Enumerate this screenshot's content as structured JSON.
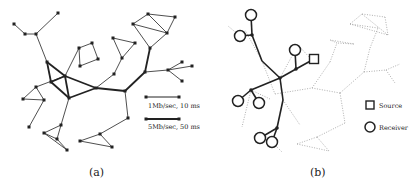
{
  "figure": {
    "panels": [
      {
        "id": "a",
        "caption": "(a)",
        "legend": [
          {
            "label": "1Mb/sec, 10 ms",
            "style": "thin"
          },
          {
            "label": "5Mb/sec, 50 ms",
            "style": "thick"
          }
        ]
      },
      {
        "id": "b",
        "caption": "(b)",
        "legend": [
          {
            "label": "Source",
            "symbol": "square"
          },
          {
            "label": "Receiver",
            "symbol": "circle"
          }
        ]
      }
    ],
    "colors": {
      "edge": "#222222",
      "node": "#222222",
      "dotted_edge": "#9a9a9a",
      "background": "#ffffff"
    }
  },
  "graph_a": {
    "nodes": [
      [
        58,
        13
      ],
      [
        14,
        24
      ],
      [
        25,
        34
      ],
      [
        36,
        34
      ],
      [
        47,
        62
      ],
      [
        65,
        76
      ],
      [
        51,
        82
      ],
      [
        69,
        98
      ],
      [
        96,
        88
      ],
      [
        125,
        91
      ],
      [
        145,
        72
      ],
      [
        150,
        48
      ],
      [
        148,
        14
      ],
      [
        133,
        24
      ],
      [
        167,
        33
      ],
      [
        175,
        17
      ],
      [
        168,
        70
      ],
      [
        182,
        62
      ],
      [
        192,
        66
      ],
      [
        182,
        81
      ],
      [
        79,
        48
      ],
      [
        92,
        43
      ],
      [
        98,
        59
      ],
      [
        80,
        66
      ],
      [
        113,
        38
      ],
      [
        135,
        43
      ],
      [
        122,
        58
      ],
      [
        114,
        74
      ],
      [
        36,
        87
      ],
      [
        23,
        99
      ],
      [
        44,
        100
      ],
      [
        29,
        127
      ],
      [
        61,
        125
      ],
      [
        44,
        133
      ],
      [
        57,
        139
      ],
      [
        67,
        150
      ],
      [
        128,
        118
      ],
      [
        100,
        134
      ],
      [
        80,
        141
      ],
      [
        112,
        147
      ]
    ],
    "thin_edges": [
      [
        0,
        3
      ],
      [
        1,
        2
      ],
      [
        2,
        3
      ],
      [
        3,
        4
      ],
      [
        5,
        20
      ],
      [
        20,
        21
      ],
      [
        21,
        22
      ],
      [
        22,
        23
      ],
      [
        23,
        20
      ],
      [
        8,
        27
      ],
      [
        27,
        26
      ],
      [
        26,
        24
      ],
      [
        24,
        25
      ],
      [
        25,
        26
      ],
      [
        9,
        36
      ],
      [
        36,
        37
      ],
      [
        37,
        38
      ],
      [
        38,
        39
      ],
      [
        39,
        37
      ],
      [
        5,
        28
      ],
      [
        28,
        29
      ],
      [
        29,
        30
      ],
      [
        30,
        28
      ],
      [
        30,
        31
      ],
      [
        7,
        32
      ],
      [
        32,
        33
      ],
      [
        33,
        34
      ],
      [
        34,
        32
      ],
      [
        33,
        35
      ],
      [
        35,
        34
      ],
      [
        10,
        16
      ],
      [
        16,
        17
      ],
      [
        16,
        18
      ],
      [
        16,
        19
      ],
      [
        11,
        13
      ],
      [
        13,
        12
      ],
      [
        12,
        14
      ],
      [
        14,
        13
      ],
      [
        14,
        15
      ],
      [
        15,
        12
      ],
      [
        11,
        14
      ]
    ],
    "thick_edges": [
      [
        4,
        6
      ],
      [
        4,
        5
      ],
      [
        6,
        5
      ],
      [
        5,
        7
      ],
      [
        6,
        7
      ],
      [
        5,
        8
      ],
      [
        7,
        8
      ],
      [
        8,
        9
      ],
      [
        9,
        10
      ],
      [
        10,
        11
      ]
    ]
  },
  "graph_b": {
    "tree_nodes": [
      [
        251,
        15
      ],
      [
        240,
        36
      ],
      [
        252,
        35
      ],
      [
        262,
        61
      ],
      [
        280,
        78
      ],
      [
        296,
        69
      ],
      [
        295,
        50
      ],
      [
        314,
        59
      ],
      [
        251,
        90
      ],
      [
        238,
        101
      ],
      [
        259,
        103
      ],
      [
        283,
        100
      ],
      [
        277,
        128
      ],
      [
        260,
        138
      ],
      [
        272,
        142
      ]
    ],
    "tree_edges": [
      [
        0,
        2
      ],
      [
        1,
        2
      ],
      [
        2,
        3
      ],
      [
        3,
        4
      ],
      [
        4,
        5
      ],
      [
        5,
        6
      ],
      [
        5,
        7
      ],
      [
        4,
        8
      ],
      [
        8,
        9
      ],
      [
        8,
        10
      ],
      [
        4,
        11
      ],
      [
        11,
        12
      ],
      [
        12,
        13
      ],
      [
        12,
        14
      ]
    ],
    "receivers": [
      0,
      1,
      6,
      9,
      10,
      13,
      14
    ],
    "source": 7,
    "junctions": [
      2,
      4,
      5,
      8,
      12
    ],
    "dotted_edges": [
      [
        [
          262,
          61
        ],
        [
          275,
          94
        ]
      ],
      [
        [
          275,
          94
        ],
        [
          312,
          88
        ]
      ],
      [
        [
          312,
          88
        ],
        [
          340,
          93
        ]
      ],
      [
        [
          340,
          93
        ],
        [
          364,
          72
        ]
      ],
      [
        [
          364,
          72
        ],
        [
          370,
          48
        ]
      ],
      [
        [
          370,
          48
        ],
        [
          378,
          28
        ]
      ],
      [
        [
          378,
          28
        ],
        [
          350,
          24
        ]
      ],
      [
        [
          350,
          24
        ],
        [
          362,
          14
        ]
      ],
      [
        [
          362,
          14
        ],
        [
          385,
          17
        ]
      ],
      [
        [
          385,
          17
        ],
        [
          388,
          35
        ]
      ],
      [
        [
          388,
          35
        ],
        [
          362,
          14
        ]
      ],
      [
        [
          350,
          24
        ],
        [
          388,
          35
        ]
      ],
      [
        [
          364,
          72
        ],
        [
          386,
          70
        ]
      ],
      [
        [
          386,
          70
        ],
        [
          400,
          64
        ]
      ],
      [
        [
          386,
          70
        ],
        [
          395,
          83
        ]
      ],
      [
        [
          340,
          93
        ],
        [
          345,
          123
        ]
      ],
      [
        [
          345,
          123
        ],
        [
          317,
          137
        ]
      ],
      [
        [
          317,
          137
        ],
        [
          297,
          144
        ]
      ],
      [
        [
          297,
          144
        ],
        [
          329,
          151
        ]
      ],
      [
        [
          329,
          151
        ],
        [
          317,
          137
        ]
      ],
      [
        [
          312,
          88
        ],
        [
          330,
          62
        ]
      ],
      [
        [
          330,
          62
        ],
        [
          337,
          43
        ]
      ],
      [
        [
          337,
          43
        ],
        [
          330,
          40
        ]
      ],
      [
        [
          330,
          40
        ],
        [
          354,
          44
        ]
      ],
      [
        [
          354,
          44
        ],
        [
          337,
          43
        ]
      ],
      [
        [
          280,
          78
        ],
        [
          298,
          45
        ]
      ],
      [
        [
          298,
          45
        ],
        [
          310,
          58
        ]
      ],
      [
        [
          251,
          90
        ],
        [
          270,
          99
        ]
      ],
      [
        [
          251,
          90
        ],
        [
          242,
          127
        ]
      ],
      [
        [
          283,
          100
        ],
        [
          300,
          125
        ]
      ],
      [
        [
          272,
          142
        ],
        [
          282,
          152
        ]
      ],
      [
        [
          262,
          61
        ],
        [
          245,
          30
        ]
      ],
      [
        [
          240,
          36
        ],
        [
          228,
          26
        ]
      ]
    ]
  }
}
